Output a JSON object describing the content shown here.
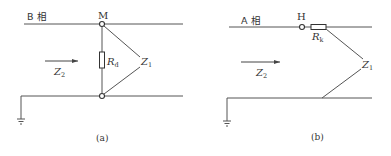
{
  "figure": {
    "panels": [
      {
        "id": "a",
        "caption": "(a)",
        "phase_label": "B 相",
        "node_label": "M",
        "resistor_label_main": "R",
        "resistor_label_sub": "d",
        "impedance_label_main": "Z",
        "impedance_label_sub": "1",
        "source_label_main": "Z",
        "source_label_sub": "2"
      },
      {
        "id": "b",
        "caption": "(b)",
        "phase_label": "A 相",
        "node_label": "H",
        "resistor_label_main": "R",
        "resistor_label_sub": "k",
        "impedance_label_main": "Z",
        "impedance_label_sub": "1",
        "source_label_main": "Z",
        "source_label_sub": "2"
      }
    ],
    "colors": {
      "line": "#555555",
      "text": "#333333",
      "background": "#ffffff"
    }
  }
}
